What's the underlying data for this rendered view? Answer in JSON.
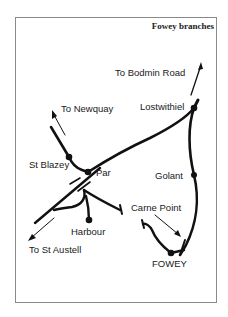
{
  "map": {
    "title": "Fowey branches",
    "labels": {
      "bodmin_road": "To Bodmin Road",
      "lostwithiel": "Lostwithiel",
      "newquay": "To Newquay",
      "st_blazey": "St Blazey",
      "par": "Par",
      "golant": "Golant",
      "carne_point": "Carne Point",
      "harbour": "Harbour",
      "st_austell": "To St Austell",
      "fowey": "FOWEY"
    },
    "stations": [
      "Lostwithiel",
      "St Blazey",
      "Par",
      "Golant",
      "Harbour",
      "FOWEY"
    ],
    "directions": [
      "To Bodmin Road",
      "To Newquay",
      "To St Austell"
    ],
    "points_of_interest": [
      "Carne Point"
    ],
    "colors": {
      "line": "#111111",
      "frame": "#8a8a8a",
      "background": "#ffffff"
    }
  }
}
